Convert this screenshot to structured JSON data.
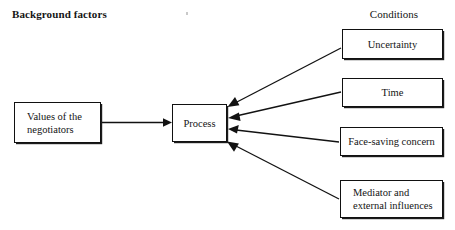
{
  "diagram": {
    "title_left": "Background factors",
    "title_right": "Conditions",
    "colors": {
      "stroke": "#121212",
      "background": "#ffffff",
      "text": "#141414"
    },
    "nodes": {
      "values": "Values of the\nnegotiators",
      "process": "Process",
      "uncertainty": "Uncertainty",
      "time": "Time",
      "face_saving": "Face-saving concern",
      "mediator": "Mediator and\nexternal influences"
    },
    "edges": [
      {
        "from": "values",
        "to": "process",
        "style": "arrow-right"
      },
      {
        "from": "uncertainty",
        "to": "process",
        "style": "arrow-left"
      },
      {
        "from": "time",
        "to": "process",
        "style": "arrow-left"
      },
      {
        "from": "face_saving",
        "to": "process",
        "style": "arrow-left"
      },
      {
        "from": "mediator",
        "to": "process",
        "style": "arrow-left"
      }
    ]
  }
}
